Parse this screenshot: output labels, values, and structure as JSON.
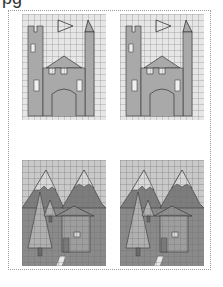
{
  "page": {
    "title_fragment": "pg",
    "border_style": "dotted",
    "border_color": "#9a9a9a"
  },
  "panels": [
    {
      "id": "castle-original",
      "subject": "castle",
      "variant": "original",
      "grid_cols": 14,
      "grid_rows": 18
    },
    {
      "id": "castle-copy",
      "subject": "castle",
      "variant": "copy",
      "grid_cols": 14,
      "grid_rows": 18
    },
    {
      "id": "mountain-house-original",
      "subject": "mountains-trees-house",
      "variant": "original",
      "grid_cols": 14,
      "grid_rows": 18
    },
    {
      "id": "mountain-house-copy",
      "subject": "mountains-trees-house",
      "variant": "copy",
      "grid_cols": 14,
      "grid_rows": 18
    }
  ],
  "colors": {
    "grid_bg": "#e6e6e6",
    "grid_line": "#8c8c8c",
    "castle_fill": "#a9a9a9",
    "castle_window": "#efefef",
    "sky": "#c9c9c9",
    "mountain_dark": "#7d7d7d",
    "mountain_light": "#bdbdbd",
    "ground": "#8a8a8a",
    "tree_fill": "#b0b0b0",
    "house_fill": "#9e9e9e",
    "path": "#e8e8e8",
    "outline": "#333333"
  }
}
